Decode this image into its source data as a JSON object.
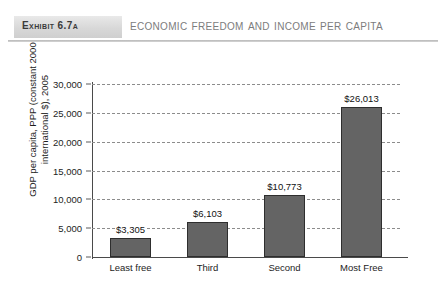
{
  "header": {
    "exhibit_tag": "Exhibit 6.7A",
    "title": "Economic Freedom and Income per Capita"
  },
  "chart_data": {
    "type": "bar",
    "title": "Economic Freedom and Income per Capita",
    "xlabel": "",
    "ylabel_line1": "GDP per capita, PPP (constant 2000",
    "ylabel_line2": "international $), 2005",
    "categories": [
      "Least free",
      "Third",
      "Second",
      "Most Free"
    ],
    "values": [
      3305,
      6103,
      10773,
      26013
    ],
    "value_labels": [
      "$3,305",
      "$6,103",
      "$10,773",
      "$26,013"
    ],
    "ylim": [
      0,
      30000
    ],
    "ytick_labels": [
      "0",
      "5,000",
      "10,000",
      "15,000",
      "20,000",
      "25,000",
      "30,000"
    ],
    "ytick_values": [
      0,
      5000,
      10000,
      15000,
      20000,
      25000,
      30000
    ],
    "grid": true,
    "gridstyle": "dashed",
    "legend": "none",
    "bar_color": "#646464",
    "bar_edge_color": "#2e2e2e",
    "background_color": "#ffffff"
  }
}
